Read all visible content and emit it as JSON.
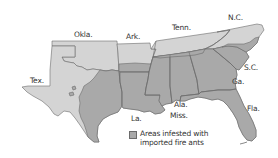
{
  "map": {
    "colors": {
      "background": "#ffffff",
      "state_fill": "#d4d4d4",
      "infested_fill": "#a9a9a9",
      "border": "#6b6b6b",
      "label": "#333333"
    },
    "state_labels": [
      {
        "id": "okla",
        "text": "Okla."
      },
      {
        "id": "ark",
        "text": "Ark."
      },
      {
        "id": "tenn",
        "text": "Tenn."
      },
      {
        "id": "nc",
        "text": "N.C."
      },
      {
        "id": "sc",
        "text": "S.C."
      },
      {
        "id": "ga",
        "text": "Ga."
      },
      {
        "id": "tex",
        "text": "Tex."
      },
      {
        "id": "la",
        "text": "La."
      },
      {
        "id": "ala",
        "text": "Ala."
      },
      {
        "id": "miss",
        "text": "Miss."
      },
      {
        "id": "fla",
        "text": "Fla."
      }
    ],
    "legend": {
      "line1": "Areas infested with",
      "line2": "imported fire ants"
    }
  }
}
